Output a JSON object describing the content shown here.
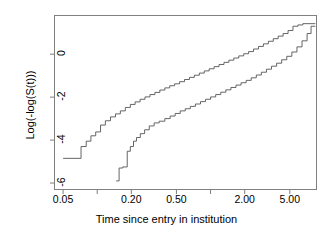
{
  "chart_data": {
    "type": "line",
    "title": "",
    "xlabel": "Time since entry in institution",
    "ylabel": "Log(-log(S(t)))",
    "xscale": "log",
    "xlim": [
      0.042,
      8.6
    ],
    "ylim": [
      -6.3,
      1.8
    ],
    "grid": false,
    "legend": null,
    "xticks": [
      {
        "value": 0.05,
        "label": "0.05"
      },
      {
        "value": 0.2,
        "label": "0.20"
      },
      {
        "value": 0.5,
        "label": "0.50"
      },
      {
        "value": 2.0,
        "label": "2.00"
      },
      {
        "value": 5.0,
        "label": "5.00"
      }
    ],
    "xticks_unlabeled": [
      0.1,
      1.0,
      10.0
    ],
    "yticks": [
      {
        "value": 0,
        "label": "0"
      },
      {
        "value": -2,
        "label": "-2"
      },
      {
        "value": -4,
        "label": "-4"
      },
      {
        "value": -6,
        "label": "-6"
      }
    ],
    "series": [
      {
        "name": "upper-curve",
        "step": true,
        "points": [
          [
            0.05,
            -4.85
          ],
          [
            0.072,
            -4.85
          ],
          [
            0.072,
            -4.3
          ],
          [
            0.08,
            -4.3
          ],
          [
            0.08,
            -4.05
          ],
          [
            0.088,
            -4.05
          ],
          [
            0.088,
            -3.8
          ],
          [
            0.097,
            -3.8
          ],
          [
            0.097,
            -3.62
          ],
          [
            0.107,
            -3.62
          ],
          [
            0.107,
            -3.3
          ],
          [
            0.118,
            -3.3
          ],
          [
            0.118,
            -3.1
          ],
          [
            0.131,
            -3.1
          ],
          [
            0.131,
            -2.92
          ],
          [
            0.145,
            -2.92
          ],
          [
            0.145,
            -2.78
          ],
          [
            0.16,
            -2.78
          ],
          [
            0.16,
            -2.64
          ],
          [
            0.177,
            -2.64
          ],
          [
            0.177,
            -2.48
          ],
          [
            0.196,
            -2.48
          ],
          [
            0.196,
            -2.34
          ],
          [
            0.216,
            -2.34
          ],
          [
            0.216,
            -2.22
          ],
          [
            0.239,
            -2.22
          ],
          [
            0.239,
            -2.1
          ],
          [
            0.264,
            -2.1
          ],
          [
            0.264,
            -1.99
          ],
          [
            0.292,
            -1.99
          ],
          [
            0.292,
            -1.88
          ],
          [
            0.323,
            -1.88
          ],
          [
            0.323,
            -1.78
          ],
          [
            0.357,
            -1.78
          ],
          [
            0.357,
            -1.67
          ],
          [
            0.395,
            -1.67
          ],
          [
            0.395,
            -1.57
          ],
          [
            0.436,
            -1.57
          ],
          [
            0.436,
            -1.47
          ],
          [
            0.482,
            -1.47
          ],
          [
            0.482,
            -1.38
          ],
          [
            0.533,
            -1.38
          ],
          [
            0.533,
            -1.28
          ],
          [
            0.589,
            -1.28
          ],
          [
            0.589,
            -1.18
          ],
          [
            0.651,
            -1.18
          ],
          [
            0.651,
            -1.08
          ],
          [
            0.72,
            -1.08
          ],
          [
            0.72,
            -0.98
          ],
          [
            0.796,
            -0.98
          ],
          [
            0.796,
            -0.88
          ],
          [
            0.88,
            -0.88
          ],
          [
            0.88,
            -0.78
          ],
          [
            0.972,
            -0.78
          ],
          [
            0.972,
            -0.68
          ],
          [
            1.075,
            -0.68
          ],
          [
            1.075,
            -0.58
          ],
          [
            1.188,
            -0.58
          ],
          [
            1.188,
            -0.48
          ],
          [
            1.313,
            -0.48
          ],
          [
            1.313,
            -0.38
          ],
          [
            1.451,
            -0.38
          ],
          [
            1.451,
            -0.28
          ],
          [
            1.604,
            -0.28
          ],
          [
            1.604,
            -0.18
          ],
          [
            1.773,
            -0.18
          ],
          [
            1.773,
            -0.08
          ],
          [
            1.96,
            -0.08
          ],
          [
            1.96,
            0.02
          ],
          [
            2.166,
            0.02
          ],
          [
            2.166,
            0.12
          ],
          [
            2.394,
            0.12
          ],
          [
            2.394,
            0.24
          ],
          [
            2.646,
            0.24
          ],
          [
            2.646,
            0.36
          ],
          [
            2.925,
            0.36
          ],
          [
            2.925,
            0.48
          ],
          [
            3.233,
            0.48
          ],
          [
            3.233,
            0.6
          ],
          [
            3.573,
            0.6
          ],
          [
            3.573,
            0.72
          ],
          [
            3.949,
            0.72
          ],
          [
            3.949,
            0.84
          ],
          [
            4.365,
            0.84
          ],
          [
            4.365,
            0.96
          ],
          [
            4.825,
            0.96
          ],
          [
            4.825,
            1.1
          ],
          [
            5.333,
            1.1
          ],
          [
            5.333,
            1.3
          ],
          [
            5.894,
            1.3
          ],
          [
            5.894,
            1.36
          ],
          [
            6.515,
            1.36
          ],
          [
            6.515,
            1.42
          ],
          [
            8.4,
            1.42
          ]
        ]
      },
      {
        "name": "lower-curve",
        "step": true,
        "points": [
          [
            0.147,
            -5.9
          ],
          [
            0.156,
            -5.9
          ],
          [
            0.156,
            -5.3
          ],
          [
            0.168,
            -5.3
          ],
          [
            0.168,
            -5.25
          ],
          [
            0.184,
            -5.25
          ],
          [
            0.184,
            -4.52
          ],
          [
            0.196,
            -4.52
          ],
          [
            0.196,
            -4.3
          ],
          [
            0.209,
            -4.3
          ],
          [
            0.209,
            -4.05
          ],
          [
            0.222,
            -4.05
          ],
          [
            0.222,
            -3.88
          ],
          [
            0.24,
            -3.88
          ],
          [
            0.24,
            -3.7
          ],
          [
            0.262,
            -3.7
          ],
          [
            0.262,
            -3.52
          ],
          [
            0.288,
            -3.52
          ],
          [
            0.288,
            -3.34
          ],
          [
            0.318,
            -3.34
          ],
          [
            0.318,
            -3.2
          ],
          [
            0.352,
            -3.2
          ],
          [
            0.352,
            -3.12
          ],
          [
            0.395,
            -3.12
          ],
          [
            0.395,
            -3.0
          ],
          [
            0.44,
            -3.0
          ],
          [
            0.44,
            -2.88
          ],
          [
            0.487,
            -2.88
          ],
          [
            0.487,
            -2.76
          ],
          [
            0.54,
            -2.76
          ],
          [
            0.54,
            -2.64
          ],
          [
            0.598,
            -2.64
          ],
          [
            0.598,
            -2.54
          ],
          [
            0.663,
            -2.54
          ],
          [
            0.663,
            -2.43
          ],
          [
            0.735,
            -2.43
          ],
          [
            0.735,
            -2.32
          ],
          [
            0.815,
            -2.32
          ],
          [
            0.815,
            -2.21
          ],
          [
            0.903,
            -2.21
          ],
          [
            0.903,
            -2.1
          ],
          [
            1.001,
            -2.1
          ],
          [
            1.001,
            -1.99
          ],
          [
            1.11,
            -1.99
          ],
          [
            1.11,
            -1.88
          ],
          [
            1.23,
            -1.88
          ],
          [
            1.23,
            -1.77
          ],
          [
            1.364,
            -1.77
          ],
          [
            1.364,
            -1.66
          ],
          [
            1.512,
            -1.66
          ],
          [
            1.512,
            -1.55
          ],
          [
            1.676,
            -1.55
          ],
          [
            1.676,
            -1.44
          ],
          [
            1.858,
            -1.44
          ],
          [
            1.858,
            -1.33
          ],
          [
            2.06,
            -1.33
          ],
          [
            2.06,
            -1.22
          ],
          [
            2.284,
            -1.22
          ],
          [
            2.284,
            -1.1
          ],
          [
            2.532,
            -1.1
          ],
          [
            2.532,
            -0.97
          ],
          [
            2.807,
            -0.97
          ],
          [
            2.807,
            -0.84
          ],
          [
            3.112,
            -0.84
          ],
          [
            3.112,
            -0.7
          ],
          [
            3.45,
            -0.7
          ],
          [
            3.45,
            -0.56
          ],
          [
            3.825,
            -0.56
          ],
          [
            3.825,
            -0.42
          ],
          [
            4.241,
            -0.42
          ],
          [
            4.241,
            -0.26
          ],
          [
            4.702,
            -0.26
          ],
          [
            4.702,
            -0.1
          ],
          [
            5.213,
            -0.1
          ],
          [
            5.213,
            0.1
          ],
          [
            5.78,
            0.1
          ],
          [
            5.78,
            0.34
          ],
          [
            6.408,
            0.34
          ],
          [
            6.408,
            0.62
          ],
          [
            7.104,
            0.62
          ],
          [
            7.104,
            0.96
          ],
          [
            7.7,
            0.96
          ],
          [
            7.7,
            1.3
          ],
          [
            8.4,
            1.3
          ]
        ]
      }
    ],
    "colors": {
      "line": "#555555",
      "axis": "#7f7f7f",
      "background": "#ffffff",
      "text": "#000000"
    }
  }
}
